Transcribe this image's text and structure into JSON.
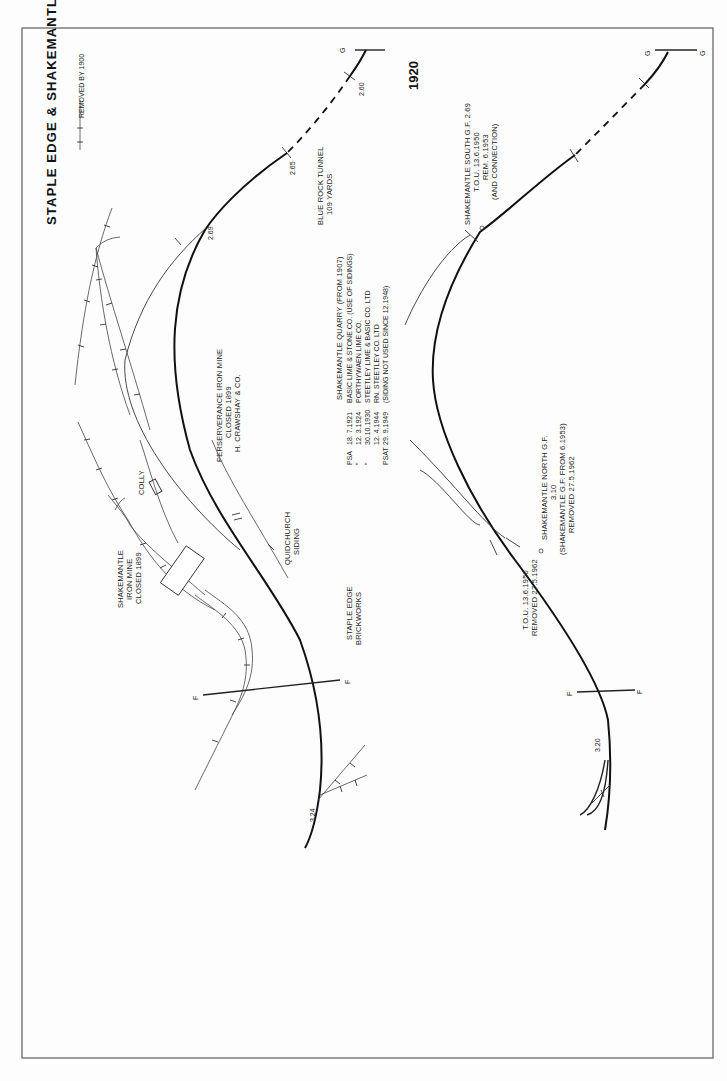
{
  "page": {
    "title": "STAPLE EDGE & SHAKEMANTLE (1880)",
    "orientation": "rotated 90° clockwise"
  },
  "legend": {
    "removed_label": "REMOVED BY 1900"
  },
  "diagram_1880": {
    "end_markers": {
      "g_left": "G",
      "f_left": "F",
      "f_right": "F"
    },
    "mileposts": {
      "m260": "2.60",
      "m265": "2.65",
      "m269": "2.69",
      "m324": "3.24"
    },
    "tunnel": {
      "line1": "BLUE ROCK TUNNEL",
      "line2": "109 YARDS"
    },
    "quarry": {
      "heading": "SHAKEMANTLE QUARRY (FROM 1907)",
      "rows": [
        {
          "code": "PSA",
          "date": "18. 7.1921",
          "text": "BASIC LIME & STONE CO. (USE OF SIDINGS)"
        },
        {
          "code": "\"",
          "date": "12. 3.1924",
          "text": "PORTHYWAEN LIME CO."
        },
        {
          "code": "\"",
          "date": "30.10.1930",
          "text": "STEETLEY LIME & BASIC CO. LTD"
        },
        {
          "code": "",
          "date": "12. 4.1944",
          "text": "RN. STEETLEY CO. LTD"
        },
        {
          "code": "PSAT",
          "date": "29. 9.1949",
          "text": "(SIDING NOT USED SINCE 12.1948)"
        }
      ]
    },
    "perserverance": {
      "line1": "PERSERVERANCE IRON MINE",
      "line2": "CLOSED 1899",
      "line3": "H. CRAWSHAY & CO."
    },
    "colly": "COLLY",
    "quidchurch": {
      "line1": "QUIDCHURCH",
      "line2": "SIDING"
    },
    "shakemantle_mine": {
      "line1": "SHAKEMANTLE",
      "line2": "IRON MINE",
      "line3": "CLOSED 1899"
    },
    "brickworks": {
      "line1": "STAPLE EDGE",
      "line2": "BRICKWORKS"
    }
  },
  "diagram_1920": {
    "year": "1920",
    "end_markers": {
      "g_left": "G",
      "g_right": "G",
      "f_left": "F",
      "f_right": "F"
    },
    "mileposts": {
      "m320": "3.20"
    },
    "south_gf": {
      "line1": "SHAKEMANTLE SOUTH G.F. 2.69",
      "line2": "T.O.U. 13.6.1950",
      "line3": "REM. 6.1953",
      "line4": "(AND CONNECTION)"
    },
    "north_gf": {
      "line1": "SHAKEMANTLE NORTH G.F.",
      "line2": "3.10",
      "line3": "(SHAKEMANTLE G.F. FROM 6.1953)",
      "line4": "REMOVED 27.5.1962"
    },
    "north_tou": {
      "line1": "T.O.U. 13.6.1950",
      "line2": "REMOVED 27.5.1962"
    }
  }
}
